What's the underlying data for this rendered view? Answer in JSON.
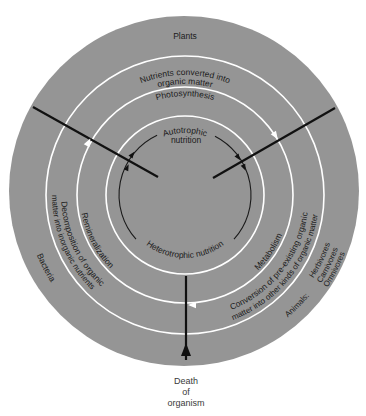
{
  "diagram": {
    "outer_labels": {
      "top": "Plants",
      "left": "Bacteria",
      "right": {
        "group": "Animals:",
        "items": [
          "Herbivores",
          "Carnivores",
          "Omnivores"
        ]
      }
    },
    "outer_ring": {
      "top": [
        "Nutrients converted into",
        "organic matter"
      ],
      "left": [
        "Decomposition of organic",
        "matter into inorganic nutrients"
      ],
      "right": [
        "Conversion of pre-existing organic",
        "matter into other kinds of organic matter"
      ]
    },
    "middle_ring": {
      "top": "Photosynthesis",
      "left": "Remineralization",
      "right": "Metabolism"
    },
    "inner_circle": {
      "top": [
        "Autotrophic",
        "nutrition"
      ],
      "bottom": "Heterotrophic nutrition"
    },
    "exit_label": [
      "Death",
      "of",
      "organism"
    ],
    "colors": {
      "background": "#ffffff",
      "disk": "#959595",
      "rings": "#ffffff",
      "lines": "#111111",
      "text": "#1c1c1c"
    }
  }
}
